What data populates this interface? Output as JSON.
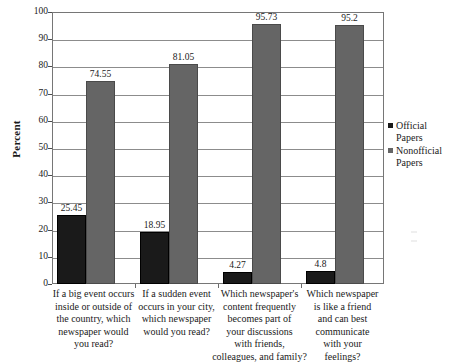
{
  "chart_data": {
    "type": "bar",
    "title": "",
    "subtitle": "",
    "xlabel": "",
    "ylabel": "Percent",
    "ylim": [
      0,
      100
    ],
    "yticks": [
      0,
      10,
      20,
      30,
      40,
      50,
      60,
      70,
      80,
      90,
      100
    ],
    "ytick_labels": [
      "0",
      "10",
      "20",
      "30",
      "40",
      "50",
      "60",
      "70",
      "80",
      "90",
      "100"
    ],
    "grid": true,
    "grid_axis": "y",
    "legend_position": "right",
    "categories": [
      "If a big event occurs inside or outside of the country, which newspaper would you read?",
      "If a sudden event occurs in your city, which newspaper would you read?",
      "Which newspaper's content frequently becomes part of your discussions with friends, colleagues, and family?",
      "Which newspaper is like a friend and can best communicate with your feelings?"
    ],
    "category_lines": [
      [
        "If a big event occurs",
        "inside or outside of",
        "the country, which",
        "newspaper would",
        "you read?"
      ],
      [
        "If a sudden event",
        "occurs in your city,",
        "which newspaper",
        "would you read?"
      ],
      [
        "Which newspaper's",
        "content frequently",
        "becomes part of",
        "your discussions",
        "with friends,",
        "colleagues, and family?"
      ],
      [
        "Which newspaper",
        "is like a friend",
        "and can best",
        "communicate",
        "with your",
        "feelings?"
      ]
    ],
    "series": [
      {
        "name": "Official Papers",
        "color": "#1a1a1a",
        "values": [
          25.45,
          18.95,
          4.27,
          4.8
        ],
        "value_labels": [
          "25.45",
          "18.95",
          "4.27",
          "4.8"
        ]
      },
      {
        "name": "Nonofficial Papers",
        "color": "#656565",
        "values": [
          74.55,
          81.05,
          95.73,
          95.2
        ],
        "value_labels": [
          "74.55",
          "81.05",
          "95.73",
          "95.2"
        ]
      }
    ]
  },
  "legend": {
    "items": [
      {
        "label_line1": "Official",
        "label_line2": "Papers"
      },
      {
        "label_line1": "Nonofficial",
        "label_line2": "Papers"
      }
    ]
  }
}
